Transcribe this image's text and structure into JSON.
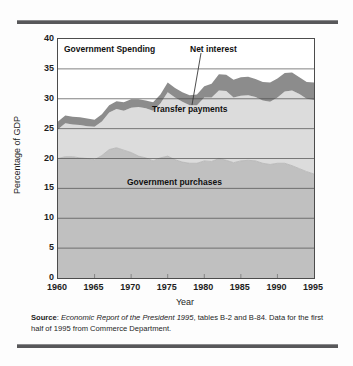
{
  "figure": {
    "plot_title": "Government Spending",
    "source_label": "Source",
    "source_colon": ": ",
    "source_italic": "Economic Report of the President 1995",
    "source_rest": ", tables B-2 and B-84. Data for the first half of 1995 from Commerce Department."
  },
  "colors": {
    "net_interest": "#8c8c8c",
    "transfer_payments": "#dcdcdc",
    "government_purchases": "#c0c0c0",
    "axis": "#4c4c4c",
    "gridline": "#4c4c4c",
    "rule": "#58585a",
    "text": "#1d1d1d"
  },
  "chart_data": {
    "type": "area",
    "title": "Government Spending",
    "xlabel": "Year",
    "ylabel": "Percentage of GDP",
    "xlim": [
      1960,
      1995
    ],
    "ylim": [
      0,
      40
    ],
    "xticks": [
      1960,
      1965,
      1970,
      1975,
      1980,
      1985,
      1990,
      1995
    ],
    "yticks": [
      0,
      5,
      10,
      15,
      20,
      25,
      30,
      35,
      40
    ],
    "grid": true,
    "legend_position": "in-plot annotations",
    "stacked": true,
    "annotations": [
      {
        "text": "Net interest",
        "leader_line": true,
        "points_to_year": 1980
      },
      {
        "text": "Transfer payments",
        "leader_line": false
      },
      {
        "text": "Government purchases",
        "leader_line": false
      }
    ],
    "x": [
      1960,
      1961,
      1962,
      1963,
      1964,
      1965,
      1966,
      1967,
      1968,
      1969,
      1970,
      1971,
      1972,
      1973,
      1974,
      1975,
      1976,
      1977,
      1978,
      1979,
      1980,
      1981,
      1982,
      1983,
      1984,
      1985,
      1986,
      1987,
      1988,
      1989,
      1990,
      1991,
      1992,
      1993,
      1994,
      1995
    ],
    "series": [
      {
        "name": "Government purchases",
        "color": "#c0c0c0",
        "values": [
          20.0,
          20.3,
          20.3,
          20.1,
          20.0,
          19.8,
          20.5,
          21.5,
          21.8,
          21.4,
          21.0,
          20.4,
          20.1,
          19.6,
          20.1,
          20.4,
          19.8,
          19.4,
          19.2,
          19.2,
          19.6,
          19.5,
          20.0,
          19.7,
          19.3,
          19.6,
          19.7,
          19.6,
          19.2,
          19.0,
          19.2,
          19.2,
          18.8,
          18.3,
          17.8,
          17.4
        ]
      },
      {
        "name": "Transfer payments",
        "color": "#dcdcdc",
        "values": [
          4.9,
          5.6,
          5.4,
          5.5,
          5.4,
          5.5,
          5.7,
          6.2,
          6.5,
          6.6,
          7.5,
          8.2,
          8.3,
          8.4,
          9.1,
          10.7,
          10.4,
          10.1,
          9.7,
          9.7,
          10.6,
          10.7,
          11.4,
          11.6,
          10.9,
          10.9,
          10.9,
          10.7,
          10.5,
          10.5,
          11.0,
          12.0,
          12.6,
          12.5,
          12.2,
          12.4
        ]
      },
      {
        "name": "Net interest",
        "color": "#8c8c8c",
        "values": [
          1.3,
          1.3,
          1.3,
          1.3,
          1.3,
          1.2,
          1.2,
          1.2,
          1.3,
          1.4,
          1.4,
          1.3,
          1.3,
          1.4,
          1.5,
          1.6,
          1.6,
          1.6,
          1.7,
          1.8,
          1.9,
          2.3,
          2.7,
          2.7,
          3.0,
          3.1,
          3.1,
          3.0,
          3.1,
          3.2,
          3.2,
          3.1,
          3.0,
          2.8,
          2.8,
          2.9
        ]
      }
    ],
    "totals": [
      26.2,
      27.2,
      27.0,
      26.9,
      26.7,
      26.5,
      27.4,
      28.9,
      29.6,
      29.4,
      29.9,
      29.9,
      29.7,
      29.4,
      30.7,
      32.7,
      31.8,
      31.1,
      30.6,
      30.7,
      32.1,
      32.5,
      34.1,
      34.0,
      33.2,
      33.6,
      33.7,
      33.3,
      32.8,
      32.7,
      33.4,
      34.3,
      34.4,
      33.6,
      32.8,
      32.7
    ]
  },
  "y_ticks": [
    "40",
    "35",
    "30",
    "25",
    "20",
    "15",
    "10",
    "5",
    "0"
  ],
  "x_ticks": [
    "1960",
    "1965",
    "1970",
    "1975",
    "1980",
    "1985",
    "1990",
    "1995"
  ]
}
